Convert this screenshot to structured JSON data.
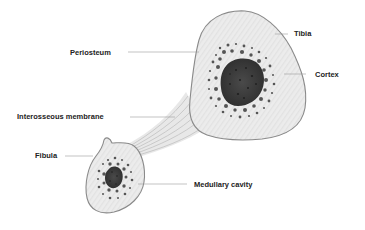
{
  "diagram": {
    "labels": {
      "tibia": "Tibia",
      "periosteum": "Periosteum",
      "cortex": "Cortex",
      "interosseous_membrane": "Interosseous membrane",
      "fibula": "Fibula",
      "medullary_cavity": "Medullary cavity"
    },
    "colors": {
      "bone_fill": "#ebebeb",
      "bone_outline": "#8a8a8a",
      "medullary_fill": "#3c3c3c",
      "dots": "#555555",
      "leader_line": "#9a9a9a",
      "label_text": "#222222"
    }
  }
}
